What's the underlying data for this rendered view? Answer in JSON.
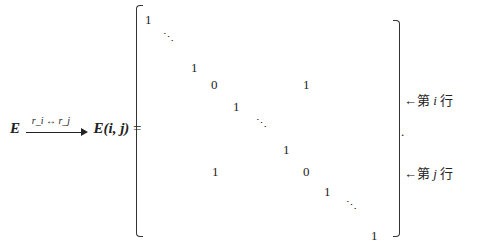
{
  "equation": {
    "lhs_matrix": "E",
    "arrow_label": "r_i ↔ r_j",
    "result": "E(i, j)",
    "equals": "="
  },
  "matrix": {
    "entries": [
      {
        "text": "1",
        "x": 145,
        "y": 12
      },
      {
        "text": "⋱",
        "x": 163,
        "y": 32,
        "kind": "dots"
      },
      {
        "text": "1",
        "x": 191,
        "y": 60
      },
      {
        "text": "0",
        "x": 211,
        "y": 77
      },
      {
        "text": "1",
        "x": 303,
        "y": 77
      },
      {
        "text": "1",
        "x": 233,
        "y": 99
      },
      {
        "text": "⋱",
        "x": 256,
        "y": 118,
        "kind": "dots"
      },
      {
        "text": "1",
        "x": 283,
        "y": 142
      },
      {
        "text": "1",
        "x": 212,
        "y": 164
      },
      {
        "text": "0",
        "x": 303,
        "y": 164
      },
      {
        "text": "1",
        "x": 324,
        "y": 184
      },
      {
        "text": "⋱",
        "x": 346,
        "y": 200,
        "kind": "dots"
      },
      {
        "text": "1",
        "x": 371,
        "y": 228
      }
    ]
  },
  "annotations": {
    "row_i": {
      "arrow": "←",
      "prefix": "第",
      "var": "i",
      "suffix": "行"
    },
    "row_j": {
      "arrow": "←",
      "prefix": "第",
      "var": "j",
      "suffix": "行"
    },
    "period": "."
  }
}
